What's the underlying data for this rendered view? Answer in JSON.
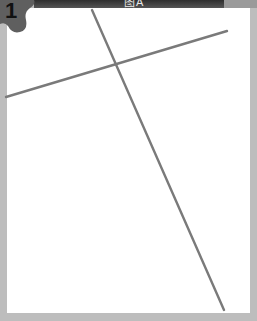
{
  "badge": {
    "number": "1",
    "color": "#5f5f5f"
  },
  "header_strip": {
    "text": "图A"
  },
  "colors": {
    "frame": "#bdbdbd",
    "panel": "#ffffff",
    "line": "#7a7a7a",
    "strip": "#3a3a3a"
  },
  "lines": [
    {
      "name": "line-a",
      "x1": 6,
      "y1": 97,
      "x2": 227,
      "y2": 31
    },
    {
      "name": "line-b",
      "x1": 92,
      "y1": 10,
      "x2": 224,
      "y2": 310
    }
  ],
  "intersection": {
    "x": 114,
    "y": 64
  }
}
